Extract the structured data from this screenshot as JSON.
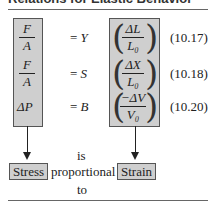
{
  "title": "Relations for Elastic Behavior",
  "rows": [
    {
      "lhs_num": "F",
      "lhs_den": "A",
      "eq": "= ",
      "modulus": "Y",
      "rhs_num": "ΔL",
      "rhs_den": "L₀",
      "label": "(10.17)"
    },
    {
      "lhs_num": "F",
      "lhs_den": "A",
      "eq": "= ",
      "modulus": "S",
      "rhs_num": "ΔX",
      "rhs_den": "L₀",
      "label": "(10.18)"
    },
    {
      "lhs_single": "ΔP",
      "eq": "= ",
      "modulus": "B",
      "rhs_num": "−ΔV",
      "rhs_den": "V₀",
      "label": "(10.20)"
    }
  ],
  "bottom": {
    "left_box": "Stress",
    "middle_top": "is",
    "middle": "proportional",
    "middle_bottom": "to",
    "right_box": "Strain"
  },
  "colors": {
    "box_fill": "#cfcfcf",
    "box_border": "#555555"
  }
}
